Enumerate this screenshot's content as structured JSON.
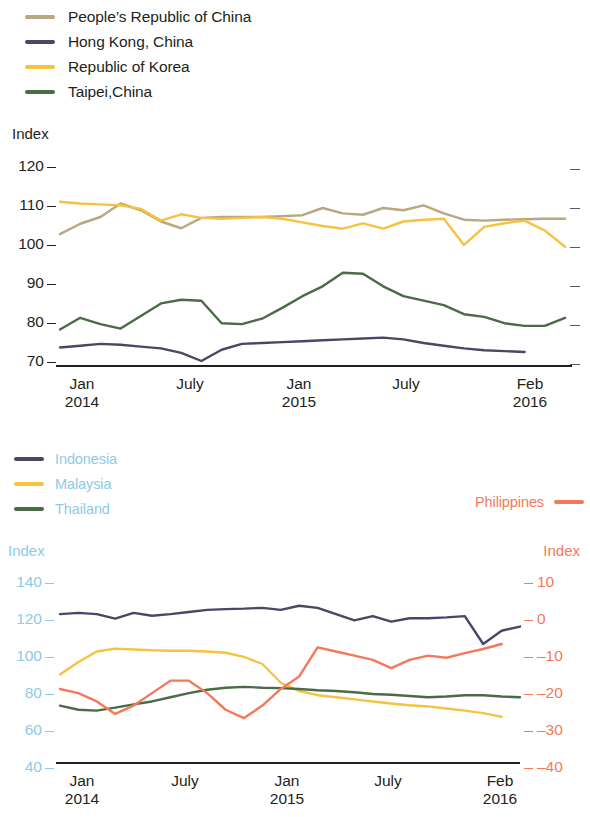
{
  "legend_top": {
    "items": [
      {
        "label": "People’s Republic of China",
        "color": "#b9a77e",
        "icon": "line-swatch"
      },
      {
        "label": "Hong Kong, China",
        "color": "#4a4666",
        "icon": "line-swatch"
      },
      {
        "label": "Republic of Korea",
        "color": "#f5c340",
        "icon": "line-swatch"
      },
      {
        "label": "Taipei,China",
        "color": "#4a6b46",
        "icon": "line-swatch"
      }
    ]
  },
  "legend_bottom": {
    "items": [
      {
        "label": "Indonesia",
        "color": "#4a4666",
        "icon": "line-swatch"
      },
      {
        "label": "Malaysia",
        "color": "#f5c340",
        "icon": "line-swatch"
      },
      {
        "label": "Thailand",
        "color": "#4a6b46",
        "icon": "line-swatch"
      }
    ],
    "right_item": {
      "label": "Philippines",
      "color": "#f4795b",
      "icon": "line-swatch"
    },
    "label_color": "#8ecae6"
  },
  "chart_data": [
    {
      "id": "chart-1",
      "type": "line",
      "title": "",
      "ylabel": "Index",
      "xlabel": "",
      "ylim": [
        70,
        120
      ],
      "yticks": [
        120,
        110,
        100,
        90,
        80,
        70
      ],
      "ytick_labels": [
        "120",
        "110",
        "100",
        "90",
        "80",
        "70"
      ],
      "grid": false,
      "legend_position": "above",
      "x": [
        "Jan 2014",
        "Feb 2014",
        "Mar 2014",
        "Apr 2014",
        "May 2014",
        "Jun 2014",
        "July 2014",
        "Aug 2014",
        "Sep 2014",
        "Oct 2014",
        "Nov 2014",
        "Dec 2014",
        "Jan 2015",
        "Feb 2015",
        "Mar 2015",
        "Apr 2015",
        "May 2015",
        "Jun 2015",
        "July 2015",
        "Aug 2015",
        "Sep 2015",
        "Oct 2015",
        "Nov 2015",
        "Dec 2015",
        "Jan 2016",
        "Feb 2016"
      ],
      "xtick_positions": [
        0,
        6,
        12,
        18,
        25
      ],
      "xtick_labels": [
        {
          "month": "Jan",
          "year": "2014"
        },
        {
          "month": "July",
          "year": ""
        },
        {
          "month": "Jan",
          "year": "2015"
        },
        {
          "month": "July",
          "year": ""
        },
        {
          "month": "Feb",
          "year": "2016"
        }
      ],
      "series": [
        {
          "name": "People’s Republic of China",
          "color": "#b9a77e",
          "values": [
            100.2,
            102.5,
            104.0,
            107.0,
            105.5,
            103.0,
            101.5,
            103.8,
            104.0,
            104.0,
            104.0,
            104.2,
            104.4,
            106.0,
            104.8,
            104.5,
            106.0,
            105.5,
            106.6,
            104.8,
            103.4,
            103.2,
            103.4,
            103.5,
            103.6,
            103.6
          ]
        },
        {
          "name": "Hong Kong, China",
          "color": "#4a4666",
          "values": [
            75.0,
            75.4,
            75.8,
            75.6,
            75.2,
            74.8,
            73.8,
            72.0,
            74.5,
            75.8,
            76.0,
            76.2,
            76.4,
            76.6,
            76.8,
            77.0,
            77.2,
            76.8,
            76.0,
            75.4,
            74.8,
            74.4,
            74.2,
            74.0,
            null,
            null
          ]
        },
        {
          "name": "Republic of Korea",
          "color": "#f5c340",
          "values": [
            107.4,
            107.0,
            106.8,
            106.6,
            105.8,
            103.2,
            104.6,
            103.8,
            103.6,
            103.8,
            104.0,
            103.6,
            102.8,
            102.0,
            101.4,
            102.6,
            101.4,
            103.0,
            103.4,
            103.6,
            97.8,
            101.8,
            102.6,
            103.2,
            101.0,
            97.4
          ]
        },
        {
          "name": "Taipei,China",
          "color": "#4a6b46",
          "values": [
            79.0,
            81.6,
            80.2,
            79.2,
            82.0,
            84.8,
            85.6,
            85.4,
            80.4,
            80.2,
            81.4,
            83.8,
            86.4,
            88.6,
            91.6,
            91.4,
            88.6,
            86.4,
            85.4,
            84.4,
            82.4,
            81.8,
            80.4,
            79.8,
            79.8,
            81.6
          ]
        }
      ]
    },
    {
      "id": "chart-2",
      "type": "line",
      "title": "",
      "ylabel": "Index",
      "ylabel_right": "Index",
      "ylim": [
        40,
        140
      ],
      "yticks": [
        140,
        120,
        100,
        80,
        60,
        40
      ],
      "ytick_labels": [
        "140",
        "120",
        "100",
        "80",
        "60",
        "40"
      ],
      "ylim_right": [
        -40,
        10
      ],
      "yticks_right": [
        10,
        0,
        -10,
        -20,
        -30,
        -40
      ],
      "ytick_labels_right": [
        "10",
        "0",
        "–10",
        "–20",
        "–30",
        "–40"
      ],
      "left_axis_color": "#8ecae6",
      "right_axis_color": "#f4795b",
      "grid": false,
      "legend_position": "above",
      "x": [
        "Jan 2014",
        "Feb 2014",
        "Mar 2014",
        "Apr 2014",
        "May 2014",
        "Jun 2014",
        "July 2014",
        "Aug 2014",
        "Sep 2014",
        "Oct 2014",
        "Nov 2014",
        "Dec 2014",
        "Jan 2015",
        "Feb 2015",
        "Mar 2015",
        "Apr 2015",
        "May 2015",
        "Jun 2015",
        "July 2015",
        "Aug 2015",
        "Sep 2015",
        "Oct 2015",
        "Nov 2015",
        "Dec 2015",
        "Jan 2016",
        "Feb 2016"
      ],
      "xtick_positions": [
        0,
        6,
        12,
        18,
        25
      ],
      "xtick_labels": [
        {
          "month": "Jan",
          "year": "2014"
        },
        {
          "month": "July",
          "year": ""
        },
        {
          "month": "Jan",
          "year": "2015"
        },
        {
          "month": "July",
          "year": ""
        },
        {
          "month": "Feb",
          "year": "2016"
        }
      ],
      "series": [
        {
          "name": "Indonesia",
          "axis": "left",
          "color": "#4a4666",
          "values": [
            114.0,
            114.6,
            114.0,
            111.8,
            114.6,
            113.2,
            114.0,
            115.0,
            116.0,
            116.4,
            116.6,
            117.0,
            116.0,
            118.0,
            117.0,
            114.0,
            111.0,
            113.0,
            110.4,
            112.0,
            112.0,
            112.4,
            113.0,
            99.6,
            106.0,
            108.0
          ]
        },
        {
          "name": "Malaysia",
          "axis": "left",
          "color": "#f5c340",
          "values": [
            85.0,
            91.0,
            96.0,
            97.4,
            97.0,
            96.6,
            96.4,
            96.4,
            96.0,
            95.4,
            93.4,
            90.0,
            81.0,
            77.0,
            75.0,
            74.0,
            73.0,
            72.0,
            71.0,
            70.2,
            69.6,
            68.6,
            67.6,
            66.4,
            64.6,
            null
          ]
        },
        {
          "name": "Thailand",
          "axis": "left",
          "color": "#4a6b46",
          "values": [
            70.0,
            68.0,
            67.6,
            69.0,
            70.6,
            72.0,
            74.0,
            76.0,
            77.6,
            78.6,
            79.0,
            78.6,
            78.4,
            78.0,
            77.4,
            77.0,
            76.4,
            75.6,
            75.2,
            74.6,
            74.0,
            74.4,
            75.0,
            75.0,
            74.4,
            74.0
          ]
        },
        {
          "name": "Philippines",
          "axis": "right",
          "color": "#f4795b",
          "values": [
            -21.0,
            -22.0,
            -24.0,
            -27.0,
            -25.0,
            -22.0,
            -19.0,
            -19.0,
            -22.0,
            -26.0,
            -28.0,
            -25.0,
            -21.0,
            -18.0,
            -11.0,
            -12.0,
            -13.0,
            -14.0,
            -16.0,
            -14.0,
            -13.0,
            -13.5,
            -12.4,
            -11.4,
            -10.2,
            null
          ]
        }
      ]
    }
  ]
}
